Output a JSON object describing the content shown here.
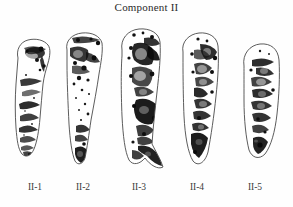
{
  "figure": {
    "title": "Component II",
    "background_color": "#fefefe",
    "ink_color": "#111111",
    "outline_color": "#4a4a4a",
    "width_px": 293,
    "height_px": 207
  },
  "plate": {
    "caption_style": "serif",
    "specimen_count": 5,
    "specimens": [
      {
        "label": "II-1",
        "shape": "elongated-curved-tapering",
        "orientation": "vertical",
        "markings": "dark diagonal bands and mottled speckle along right margin",
        "label_x": 34,
        "left_px": 12,
        "top_px": 38,
        "width_px": 42,
        "height_px": 120
      },
      {
        "label": "II-2",
        "shape": "wedge-tapering-downward",
        "orientation": "vertical",
        "markings": "heavy speckle upper left, dark cluster at basal tip",
        "label_x": 82,
        "left_px": 62,
        "top_px": 32,
        "width_px": 46,
        "height_px": 132
      },
      {
        "label": "II-3",
        "shape": "long-curved-with-basal-hook",
        "orientation": "vertical",
        "markings": "broad dark blotches mid-body, dense black band near base",
        "label_x": 138,
        "left_px": 117,
        "top_px": 28,
        "width_px": 50,
        "height_px": 145
      },
      {
        "label": "II-4",
        "shape": "elongated-oval-tapering",
        "orientation": "vertical",
        "markings": "mottled speckle along right side, black streak down centre",
        "label_x": 196,
        "left_px": 176,
        "top_px": 32,
        "width_px": 46,
        "height_px": 136
      },
      {
        "label": "II-5",
        "shape": "rounded-oval",
        "orientation": "vertical",
        "markings": "dark transverse bars across middle, dark spot at base",
        "label_x": 254,
        "left_px": 236,
        "top_px": 42,
        "width_px": 46,
        "height_px": 120
      }
    ]
  }
}
